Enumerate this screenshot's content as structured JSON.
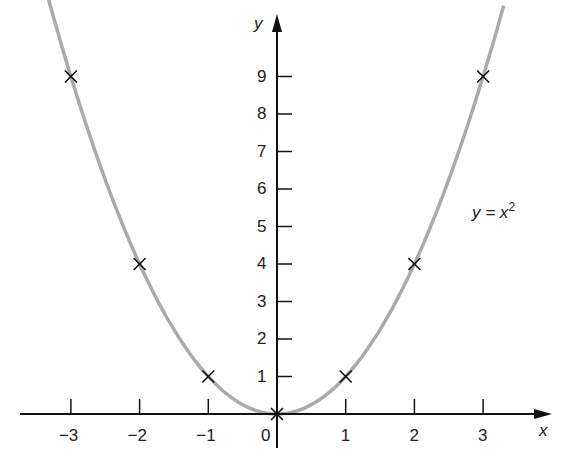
{
  "chart_data": {
    "type": "line",
    "title": "",
    "xlabel": "x",
    "ylabel": "y",
    "x_ticks": [
      "−3",
      "−2",
      "−1",
      "0",
      "1",
      "2",
      "3"
    ],
    "y_ticks": [
      "1",
      "2",
      "3",
      "4",
      "5",
      "6",
      "7",
      "8",
      "9"
    ],
    "xlim": [
      -3.35,
      3.9
    ],
    "ylim": [
      0,
      10.2
    ],
    "grid": false,
    "series": [
      {
        "name": "y = x²",
        "curve": "y = x^2",
        "color": "#aaaaaa",
        "marked_points": [
          {
            "x": -3,
            "y": 9
          },
          {
            "x": -2,
            "y": 4
          },
          {
            "x": -1,
            "y": 1
          },
          {
            "x": 0,
            "y": 0
          },
          {
            "x": 1,
            "y": 1
          },
          {
            "x": 2,
            "y": 4
          },
          {
            "x": 3,
            "y": 9
          }
        ]
      }
    ],
    "annotations": [
      {
        "text": "y = x²",
        "near": {
          "x": 3.0,
          "y": 5.5
        }
      }
    ]
  },
  "labels": {
    "x_axis": "x",
    "y_axis": "y",
    "curve_label_y": "y = x",
    "curve_label_exp": "2",
    "origin": "0"
  }
}
